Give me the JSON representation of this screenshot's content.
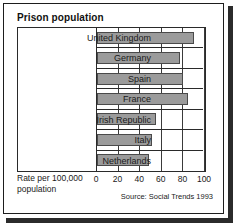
{
  "figure": {
    "title": "Prison population",
    "axis_title_line1": "Rate per 100,000",
    "axis_title_line2": "population",
    "source": "Source: Social Trends 1993"
  },
  "style": {
    "bar_fill": "#9b9b9b",
    "bar_stroke": "#4a4a4a",
    "frame_color": "#1d1d1d",
    "shadow_color": "#2b2b2b",
    "text_color": "#1a1a1a"
  },
  "chart_data": {
    "type": "bar",
    "orientation": "horizontal",
    "title": "Prison population",
    "xlabel": "Rate per 100,000 population",
    "ylabel": "",
    "xlim": [
      0,
      100
    ],
    "xticks": [
      0,
      20,
      40,
      60,
      80,
      100
    ],
    "xtick_labels": [
      "0",
      "20",
      "40",
      "60",
      "80",
      "100"
    ],
    "grid": true,
    "grid_axis": "x",
    "legend": false,
    "categories": [
      "United Kingdom",
      "Germany",
      "Spain",
      "France",
      "Irish Republic",
      "Italy",
      "Netherlands"
    ],
    "values": [
      90,
      77,
      80,
      84,
      55,
      51,
      48
    ],
    "annotations": [
      "Source: Social Trends 1993"
    ]
  }
}
